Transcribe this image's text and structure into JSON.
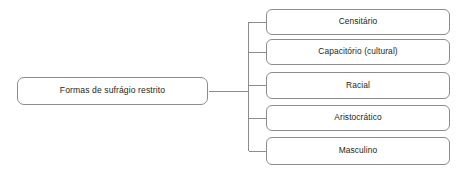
{
  "diagram": {
    "type": "tree-hierarchy",
    "orientation": "left-to-right",
    "root": {
      "label": "Formas de sufrágio restrito"
    },
    "children": [
      {
        "label": "Censitário"
      },
      {
        "label": "Capacitório (cultural)"
      },
      {
        "label": "Racial"
      },
      {
        "label": "Aristocrático"
      },
      {
        "label": "Masculino"
      }
    ],
    "colors": {
      "background": "#ffffff",
      "box_border": "#8c8c8c",
      "box_fill": "#ffffff",
      "text": "#231f20",
      "connector": "#8c8c8c"
    }
  }
}
